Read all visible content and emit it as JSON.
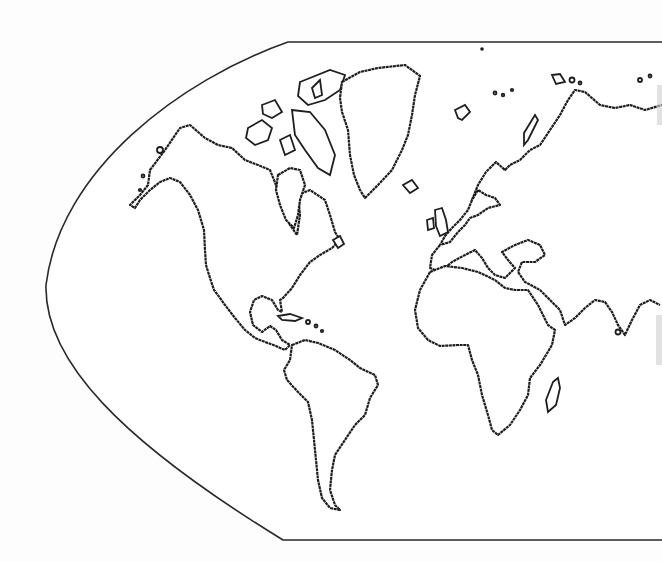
{
  "map": {
    "type": "outline world map",
    "projection": "pseudo-cylindrical (western hemisphere curved edge, cropped on right)",
    "style": "black continent outlines on white, no labels",
    "colors": {
      "background": "#fdfdfd",
      "outline": "#1e1e1e",
      "land_fill": "#ffffff"
    },
    "visible_regions": [
      "North America",
      "Greenland",
      "Canadian Arctic Archipelago",
      "Central America",
      "Caribbean",
      "South America",
      "Iceland",
      "Europe",
      "British Isles",
      "Scandinavia",
      "Svalbard",
      "Novaya Zemlya",
      "Northern Russia",
      "Mediterranean",
      "Africa",
      "Madagascar",
      "Arabian Peninsula",
      "India (partial)"
    ],
    "labels": []
  }
}
